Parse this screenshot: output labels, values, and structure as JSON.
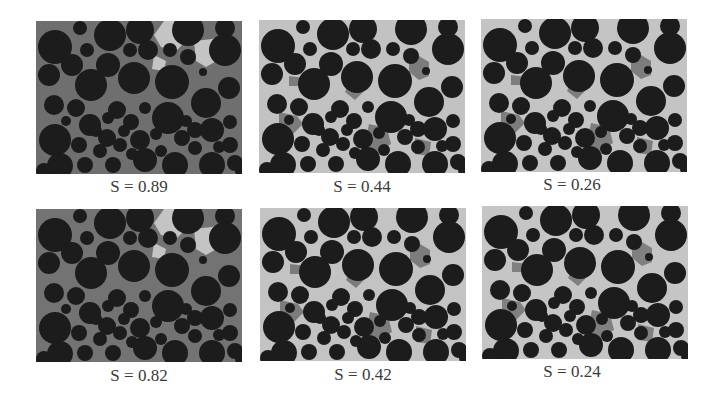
{
  "figure": {
    "panels": [
      {
        "label": "S = 0.89",
        "matrix": "#6f6f6f",
        "phase": "#c4c4c4",
        "row": 0,
        "col": 0
      },
      {
        "label": "S = 0.44",
        "matrix": "#c2c2c2",
        "phase": "#7c7c7c",
        "row": 0,
        "col": 1
      },
      {
        "label": "S = 0.26",
        "matrix": "#c4c4c4",
        "phase": "#7d7d7d",
        "row": 0,
        "col": 2
      },
      {
        "label": "S = 0.82",
        "matrix": "#737373",
        "phase": "#c4c4c4",
        "row": 1,
        "col": 0
      },
      {
        "label": "S = 0.42",
        "matrix": "#c3c3c3",
        "phase": "#7c7c7c",
        "row": 1,
        "col": 1
      },
      {
        "label": "S = 0.24",
        "matrix": "#c5c5c5",
        "phase": "#808080",
        "row": 1,
        "col": 2
      }
    ],
    "particle_color": "#1c1c1c"
  }
}
